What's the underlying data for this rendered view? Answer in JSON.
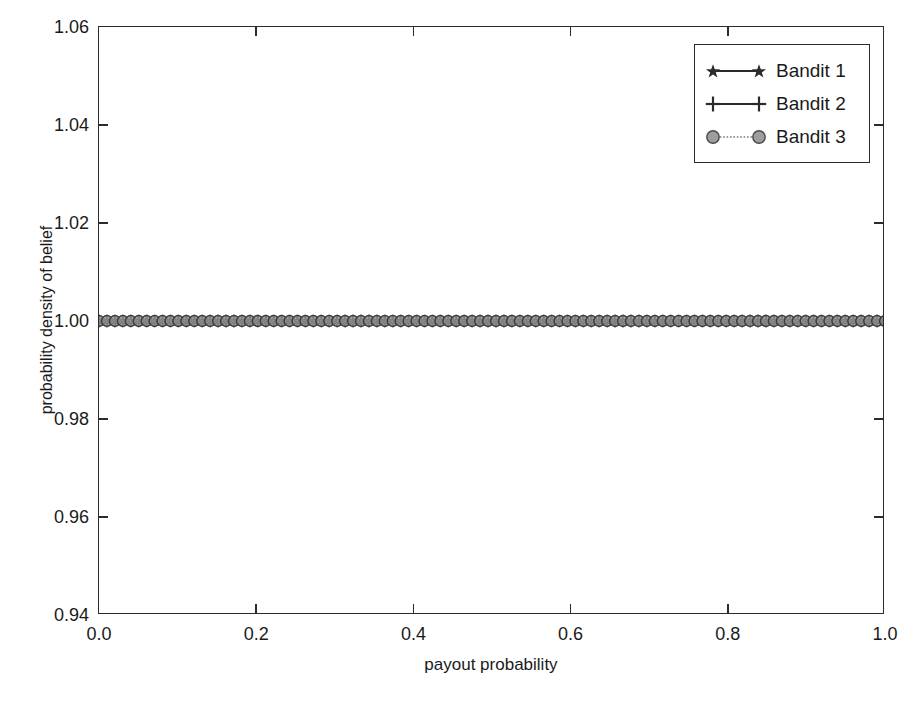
{
  "chart_data": {
    "type": "line",
    "title": "",
    "xlabel": "payout probability",
    "ylabel": "probability density of belief",
    "xlim": [
      0.0,
      1.0
    ],
    "ylim": [
      0.94,
      1.06
    ],
    "xticks": [
      "0.0",
      "0.2",
      "0.4",
      "0.6",
      "0.8",
      "1.0"
    ],
    "xtick_values": [
      0.0,
      0.2,
      0.4,
      0.6,
      0.8,
      1.0
    ],
    "yticks": [
      "0.94",
      "0.96",
      "0.98",
      "1.00",
      "1.02",
      "1.04",
      "1.06"
    ],
    "ytick_values": [
      0.94,
      0.96,
      0.98,
      1.0,
      1.02,
      1.04,
      1.06
    ],
    "grid": false,
    "legend_position": "upper right",
    "x": [
      0.0,
      0.0101,
      0.0202,
      0.0303,
      0.0404,
      0.0505,
      0.0606,
      0.0707,
      0.0808,
      0.0909,
      0.101,
      0.1111,
      0.1212,
      0.1313,
      0.1414,
      0.1515,
      0.1616,
      0.1717,
      0.1818,
      0.1919,
      0.202,
      0.2121,
      0.2222,
      0.2323,
      0.2424,
      0.2525,
      0.2626,
      0.2727,
      0.2828,
      0.2929,
      0.303,
      0.3131,
      0.3232,
      0.3333,
      0.3434,
      0.3535,
      0.3636,
      0.3737,
      0.3838,
      0.3939,
      0.404,
      0.4141,
      0.4242,
      0.4343,
      0.4444,
      0.4545,
      0.4646,
      0.4747,
      0.4848,
      0.4949,
      0.5051,
      0.5152,
      0.5253,
      0.5354,
      0.5455,
      0.5556,
      0.5657,
      0.5758,
      0.5859,
      0.596,
      0.6061,
      0.6162,
      0.6263,
      0.6364,
      0.6465,
      0.6566,
      0.6667,
      0.6768,
      0.6869,
      0.697,
      0.7071,
      0.7172,
      0.7273,
      0.7374,
      0.7475,
      0.7576,
      0.7677,
      0.7778,
      0.7879,
      0.798,
      0.8081,
      0.8182,
      0.8283,
      0.8384,
      0.8485,
      0.8586,
      0.8687,
      0.8788,
      0.8889,
      0.899,
      0.9091,
      0.9192,
      0.9293,
      0.9394,
      0.9495,
      0.9596,
      0.9697,
      0.9798,
      0.9899,
      1.0
    ],
    "series": [
      {
        "name": "Bandit 1",
        "marker": "star",
        "color": "#2b2b2b",
        "linestyle": "solid",
        "constant_value": 1.0
      },
      {
        "name": "Bandit 2",
        "marker": "plus",
        "color": "#2b2b2b",
        "linestyle": "solid",
        "constant_value": 1.0
      },
      {
        "name": "Bandit 3",
        "marker": "circle",
        "color": "#7a7a7a",
        "linestyle": "dotted",
        "constant_value": 1.0
      }
    ]
  },
  "legend": {
    "entries": [
      {
        "label": "Bandit 1"
      },
      {
        "label": "Bandit 2"
      },
      {
        "label": "Bandit 3"
      }
    ]
  }
}
